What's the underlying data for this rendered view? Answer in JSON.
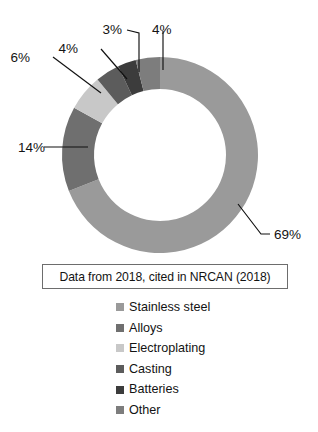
{
  "chart_data": {
    "type": "pie",
    "variant": "donut",
    "title": "",
    "xlabel": "",
    "ylabel": "",
    "legend_position": "bottom",
    "grid": false,
    "start_angle_deg": 0,
    "direction": "clockwise",
    "units": "percent",
    "categories": [
      "Stainless steel",
      "Alloys",
      "Electroplating",
      "Casting",
      "Batteries",
      "Other"
    ],
    "values": [
      69,
      14,
      6,
      4,
      3,
      4
    ],
    "labels": [
      "69%",
      "14%",
      "6%",
      "4%",
      "3%",
      "4%"
    ],
    "colors": [
      "#9a9a9a",
      "#6f6f6f",
      "#c8c8c8",
      "#5c5c5c",
      "#3c3c3c",
      "#7d7d7d"
    ],
    "slices": [
      {
        "name": "Stainless steel",
        "value": 69,
        "label": "69%",
        "color": "#9a9a9a"
      },
      {
        "name": "Alloys",
        "value": 14,
        "label": "14%",
        "color": "#6f6f6f"
      },
      {
        "name": "Electroplating",
        "value": 6,
        "label": "6%",
        "color": "#c8c8c8"
      },
      {
        "name": "Casting",
        "value": 4,
        "label": "4%",
        "color": "#5c5c5c"
      },
      {
        "name": "Batteries",
        "value": 3,
        "label": "3%",
        "color": "#3c3c3c"
      },
      {
        "name": "Other",
        "value": 4,
        "label": "4%",
        "color": "#7d7d7d"
      }
    ],
    "caption": "Data from 2018, cited in NRCAN (2018)"
  },
  "caption": {
    "text": "Data from 2018, cited in NRCAN (2018)",
    "border_color": "#6d6d6d"
  },
  "labels": {
    "stainless_steel": "69%",
    "alloys": "14%",
    "electroplating": "6%",
    "casting": "4%",
    "batteries": "3%",
    "other": "4%"
  },
  "legend": {
    "items": [
      {
        "label": "Stainless steel",
        "color": "#9a9a9a"
      },
      {
        "label": "Alloys",
        "color": "#6f6f6f"
      },
      {
        "label": "Electroplating",
        "color": "#c8c8c8"
      },
      {
        "label": "Casting",
        "color": "#5c5c5c"
      },
      {
        "label": "Batteries",
        "color": "#3c3c3c"
      },
      {
        "label": "Other",
        "color": "#7d7d7d"
      }
    ]
  }
}
